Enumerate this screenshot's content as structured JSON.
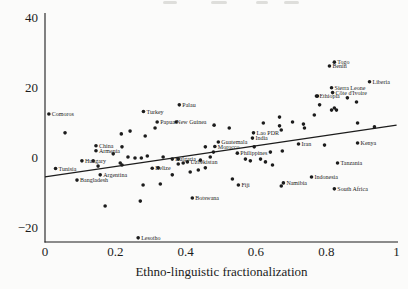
{
  "figure": {
    "background": "#fbfbfa",
    "ink": "#1c1c1c"
  },
  "chart_data": {
    "type": "scatter",
    "title": "",
    "xlabel": "Ethno-linguistic fractionalization",
    "ylabel": "",
    "xlim": [
      0,
      1
    ],
    "ylim": [
      -25,
      42
    ],
    "grid": false,
    "legend_position": "none",
    "x_ticks": [
      "0",
      "0.2",
      "0.4",
      "0.6",
      "0.8",
      "1"
    ],
    "x_tick_values": [
      0,
      0.2,
      0.4,
      0.6,
      0.8,
      1
    ],
    "y_ticks": [
      "40",
      "20",
      "0",
      "−20"
    ],
    "y_tick_values": [
      40,
      20,
      0,
      -20
    ],
    "trend_line": {
      "x": [
        0,
        1
      ],
      "y": [
        -5.7,
        9.1
      ]
    },
    "labeled_points": [
      {
        "label": "Comoros",
        "x": 0.011,
        "y": 12.3
      },
      {
        "label": "Tunisia",
        "x": 0.03,
        "y": -3.3
      },
      {
        "label": "Bangladesh",
        "x": 0.091,
        "y": -6.6
      },
      {
        "label": "Hungary",
        "x": 0.105,
        "y": -1.1
      },
      {
        "label": "China",
        "x": 0.145,
        "y": 3.2
      },
      {
        "label": "Armenia",
        "x": 0.145,
        "y": 1.8
      },
      {
        "label": "Argentina",
        "x": 0.157,
        "y": -5.1
      },
      {
        "label": "Lesotho",
        "x": 0.265,
        "y": -23.1
      },
      {
        "label": "Turkey",
        "x": 0.28,
        "y": 13.0
      },
      {
        "label": "Belize",
        "x": 0.305,
        "y": -3.2
      },
      {
        "label": "Papua New Guinea",
        "x": 0.319,
        "y": 10.0
      },
      {
        "label": "Bulgaria",
        "x": 0.362,
        "y": -0.6
      },
      {
        "label": "Palau",
        "x": 0.382,
        "y": 14.9
      },
      {
        "label": "Uzbekistan",
        "x": 0.405,
        "y": -1.4
      },
      {
        "label": "Botswana",
        "x": 0.419,
        "y": -11.7
      },
      {
        "label": "Morocco",
        "x": 0.483,
        "y": 3.0
      },
      {
        "label": "Guatemala",
        "x": 0.493,
        "y": 4.3
      },
      {
        "label": "Philippines",
        "x": 0.547,
        "y": 1.1
      },
      {
        "label": "Fiji",
        "x": 0.55,
        "y": -8.0
      },
      {
        "label": "India",
        "x": 0.59,
        "y": 5.4
      },
      {
        "label": "Lao PDR",
        "x": 0.593,
        "y": 6.9
      },
      {
        "label": "Namibia",
        "x": 0.678,
        "y": -7.4
      },
      {
        "label": "Iran",
        "x": 0.721,
        "y": 3.7
      },
      {
        "label": "Indonesia",
        "x": 0.758,
        "y": -5.7
      },
      {
        "label": "Ethiopia",
        "x": 0.772,
        "y": 17.4
      },
      {
        "label": "Benin",
        "x": 0.809,
        "y": 26.0
      },
      {
        "label": "Sierra Leone",
        "x": 0.815,
        "y": 19.8
      },
      {
        "label": "Côte d'Ivoire",
        "x": 0.818,
        "y": 18.4
      },
      {
        "label": "Togo",
        "x": 0.823,
        "y": 27.1
      },
      {
        "label": "South Africa",
        "x": 0.823,
        "y": -9.1
      },
      {
        "label": "Tanzania",
        "x": 0.832,
        "y": -1.7
      },
      {
        "label": "Kenya",
        "x": 0.889,
        "y": 4.0
      },
      {
        "label": "Liberia",
        "x": 0.923,
        "y": 21.5
      }
    ],
    "unlabeled_points": [
      [
        0.057,
        6.9
      ],
      [
        0.217,
        6.6
      ],
      [
        0.242,
        7.4
      ],
      [
        0.285,
        6.0
      ],
      [
        0.313,
        8.3
      ],
      [
        0.373,
        10.0
      ],
      [
        0.219,
        2.9
      ],
      [
        0.194,
        0.9
      ],
      [
        0.137,
        -1.1
      ],
      [
        0.151,
        -2.6
      ],
      [
        0.219,
        -2.3
      ],
      [
        0.236,
        0.0
      ],
      [
        0.256,
        -0.3
      ],
      [
        0.274,
        -0.3
      ],
      [
        0.291,
        0.3
      ],
      [
        0.322,
        -3.1
      ],
      [
        0.336,
        0.0
      ],
      [
        0.379,
        -0.6
      ],
      [
        0.379,
        -2.0
      ],
      [
        0.393,
        -1.7
      ],
      [
        0.442,
        -0.9
      ],
      [
        0.456,
        -3.1
      ],
      [
        0.47,
        0.0
      ],
      [
        0.436,
        -3.7
      ],
      [
        0.456,
        2.9
      ],
      [
        0.479,
        1.4
      ],
      [
        0.413,
        -4.3
      ],
      [
        0.362,
        -5.1
      ],
      [
        0.214,
        -1.7
      ],
      [
        0.279,
        -8.0
      ],
      [
        0.328,
        -7.7
      ],
      [
        0.171,
        -14.0
      ],
      [
        0.271,
        -12.6
      ],
      [
        0.533,
        -6.3
      ],
      [
        0.481,
        9.1
      ],
      [
        0.524,
        8.3
      ],
      [
        0.621,
        9.7
      ],
      [
        0.672,
        7.7
      ],
      [
        0.735,
        9.4
      ],
      [
        0.795,
        3.4
      ],
      [
        0.595,
        2.9
      ],
      [
        0.675,
        1.7
      ],
      [
        0.641,
        1.4
      ],
      [
        0.57,
        -0.6
      ],
      [
        0.584,
        -1.1
      ],
      [
        0.613,
        -0.6
      ],
      [
        0.627,
        -1.4
      ],
      [
        0.647,
        -2.3
      ],
      [
        0.672,
        -8.3
      ],
      [
        0.86,
        16.9
      ],
      [
        0.886,
        15.7
      ],
      [
        0.781,
        14.9
      ],
      [
        0.823,
        14.0
      ],
      [
        0.815,
        13.4
      ],
      [
        0.829,
        13.4
      ],
      [
        0.766,
        12.0
      ],
      [
        0.667,
        11.4
      ],
      [
        0.704,
        10.0
      ],
      [
        0.667,
        8.9
      ],
      [
        0.738,
        8.3
      ],
      [
        0.889,
        9.7
      ],
      [
        0.937,
        8.6
      ],
      [
        0.775,
        17.4
      ]
    ]
  }
}
